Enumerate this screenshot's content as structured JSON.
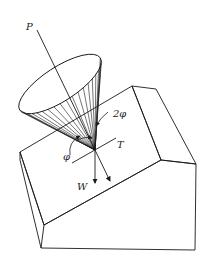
{
  "diagram": {
    "labels": {
      "force_p": "P",
      "angle_2phi": "2φ",
      "angle_phi": "φ",
      "tangent_t": "T",
      "weight_w": "W"
    },
    "colors": {
      "stroke": "#1a1a1a",
      "background": "#ffffff"
    }
  }
}
